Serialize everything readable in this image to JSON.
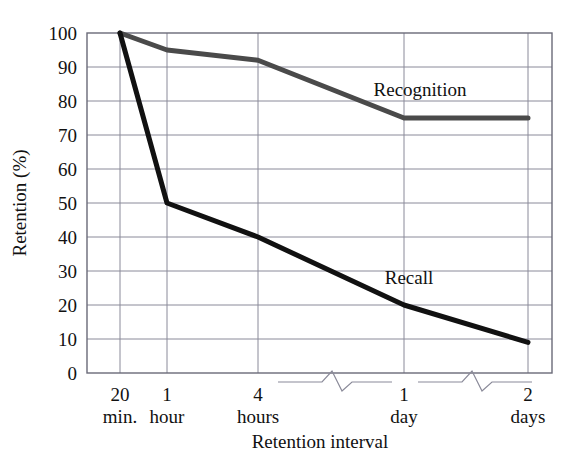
{
  "chart_data": {
    "type": "line",
    "title": "",
    "xlabel": "Retention interval",
    "ylabel": "Retention (%)",
    "categories": [
      "20\nmin.",
      "1\nhour",
      "4\nhours",
      "1\nday",
      "2\ndays"
    ],
    "x_tick_labels": [
      {
        "top": "20",
        "bottom": "min."
      },
      {
        "top": "1",
        "bottom": "hour"
      },
      {
        "top": "4",
        "bottom": "hours"
      },
      {
        "top": "1",
        "bottom": "day"
      },
      {
        "top": "2",
        "bottom": "days"
      }
    ],
    "y_tick_labels": [
      "0",
      "10",
      "20",
      "30",
      "40",
      "50",
      "60",
      "70",
      "80",
      "90",
      "100"
    ],
    "ylim": [
      0,
      100
    ],
    "y_step": 10,
    "grid": true,
    "legend": "inline-labels",
    "axis_breaks": 2,
    "series": [
      {
        "name": "Recognition",
        "values": [
          100,
          95,
          92,
          75,
          75
        ],
        "color": "#4a4a4a",
        "label_x": 420,
        "label_y": 96
      },
      {
        "name": "Recall",
        "values": [
          100,
          50,
          40,
          20,
          9
        ],
        "color": "#111111",
        "label_x": 409,
        "label_y": 284
      }
    ]
  },
  "axes": {
    "plot_left": 87,
    "plot_right": 552,
    "plot_top": 33,
    "plot_bottom": 373,
    "x_positions": [
      120,
      167,
      258,
      404,
      528
    ],
    "grid_color": "#8a8a99",
    "border_color": "#6a6a78"
  }
}
